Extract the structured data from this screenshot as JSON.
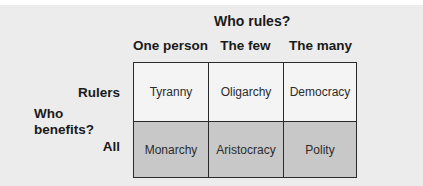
{
  "diagram": {
    "column_axis_title": "Who rules?",
    "row_axis_title": "Who benefits?",
    "columns": [
      "One person",
      "The few",
      "The many"
    ],
    "rows": [
      "Rulers",
      "All"
    ],
    "cells": [
      [
        "Tyranny",
        "Oligarchy",
        "Democracy"
      ],
      [
        "Monarchy",
        "Aristocracy",
        "Polity"
      ]
    ],
    "row_shading": [
      "light",
      "dark"
    ],
    "colors": {
      "background": "#ececec",
      "light_cell": "#f4f4f4",
      "dark_cell": "#c8c8c8",
      "border": "#2a2a2a",
      "text": "#1a1a1a"
    }
  }
}
